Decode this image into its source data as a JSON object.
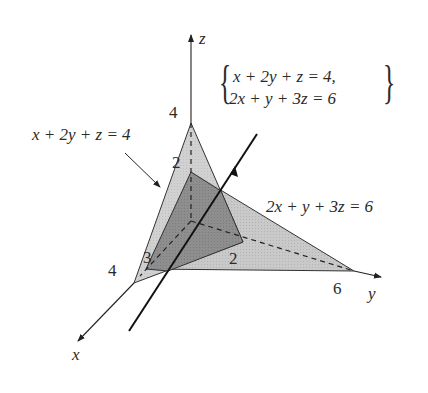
{
  "diagram": {
    "type": "3d-planes-intersection",
    "axes": {
      "x_label": "x",
      "y_label": "y",
      "z_label": "z"
    },
    "planes": [
      {
        "name": "plane-1",
        "equation": "x + 2y + z = 4",
        "intercepts": {
          "x": "4",
          "y": "2",
          "z": "4"
        },
        "fill": "#c8c8c8"
      },
      {
        "name": "plane-2",
        "equation": "2x + y + 3z = 6",
        "intercepts": {
          "x": "3",
          "y": "6",
          "z": "2"
        },
        "fill": "#c8c8c8"
      }
    ],
    "overlap_fill": "#8f8f8f",
    "system": {
      "line1": "x + 2y + z = 4,",
      "line2": "2x + y + 3z = 6"
    },
    "tick_labels": {
      "z4": "4",
      "z2": "2",
      "x4": "4",
      "x3": "3",
      "y2": "2",
      "y6": "6"
    }
  }
}
